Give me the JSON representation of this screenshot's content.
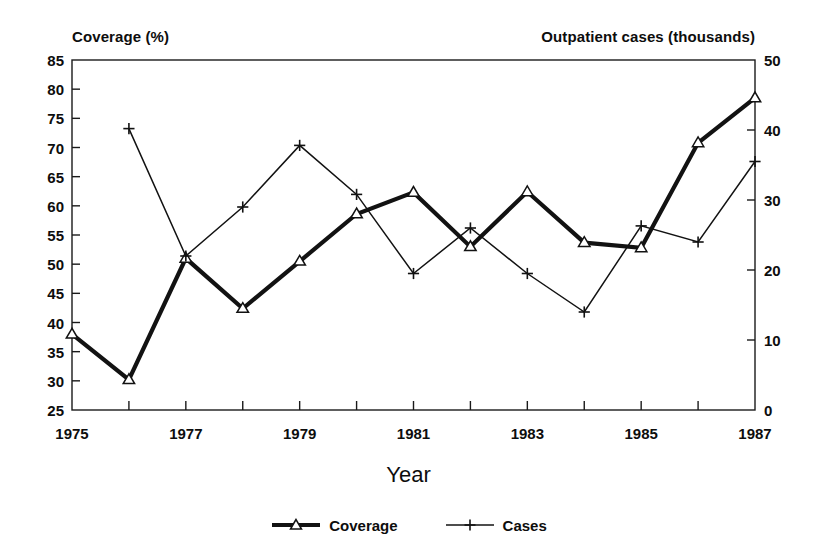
{
  "chart_data": {
    "type": "line",
    "title": "",
    "xlabel": "Year",
    "left_axis_label": "Coverage (%)",
    "right_axis_label": "Outpatient cases (thousands)",
    "x": [
      1975,
      1976,
      1977,
      1978,
      1979,
      1980,
      1981,
      1982,
      1983,
      1984,
      1985,
      1986,
      1987
    ],
    "x_tick_labels": [
      "1975",
      "",
      "1977",
      "",
      "1979",
      "",
      "1981",
      "",
      "1983",
      "",
      "1985",
      "",
      "1987"
    ],
    "x_labels_shown": [
      "1975",
      "1977",
      "1979",
      "1981",
      "1983",
      "1985",
      "1987"
    ],
    "xlim": [
      1975,
      1987
    ],
    "left_ticks": [
      25,
      30,
      35,
      40,
      45,
      50,
      55,
      60,
      65,
      70,
      75,
      80,
      85
    ],
    "left_tick_labels": [
      "25",
      "30",
      "35",
      "40",
      "45",
      "50",
      "55",
      "60",
      "65",
      "70",
      "75",
      "80",
      "85"
    ],
    "ylim_left": [
      25,
      85
    ],
    "right_ticks": [
      0,
      10,
      20,
      30,
      40,
      50
    ],
    "right_tick_labels": [
      "0",
      "10",
      "20",
      "30",
      "40",
      "50"
    ],
    "ylim_right": [
      0,
      50
    ],
    "grid": false,
    "legend_position": "bottom-center",
    "series": [
      {
        "name": "Coverage",
        "axis": "left",
        "marker": "triangle",
        "line_width": "thick",
        "color": "#121212",
        "values": [
          38.0,
          30.2,
          51.0,
          42.4,
          50.5,
          58.6,
          62.3,
          53.0,
          62.4,
          53.7,
          52.8,
          70.8,
          78.5
        ]
      },
      {
        "name": "Cases",
        "axis": "right",
        "marker": "plus",
        "line_width": "thin",
        "color": "#121212",
        "values": [
          null,
          40.2,
          22.0,
          29.0,
          37.8,
          30.8,
          19.5,
          26.0,
          19.5,
          14.0,
          26.3,
          24.0,
          35.5
        ]
      }
    ],
    "annotations": []
  },
  "legend": {
    "entries": [
      {
        "label": "Coverage",
        "marker": "triangle-marker",
        "style": "thick-line"
      },
      {
        "label": "Cases",
        "marker": "plus-marker",
        "style": "thin-line"
      }
    ]
  },
  "colors": {
    "ink": "#121212",
    "frame": "#1a1a1a",
    "background": "#ffffff"
  }
}
